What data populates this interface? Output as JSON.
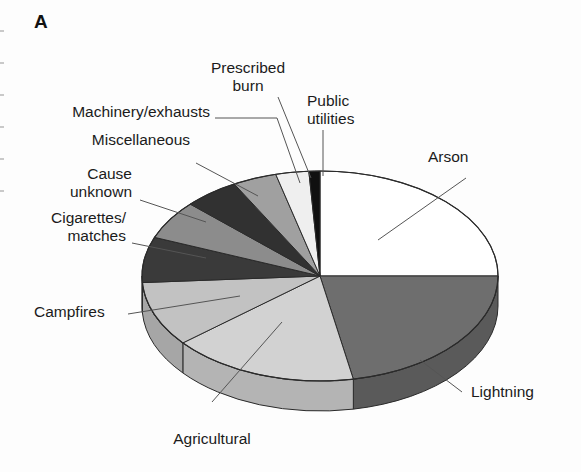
{
  "figure": {
    "panel_label": "A",
    "background_color": "#fdfdfd"
  },
  "chart_data": {
    "type": "pie",
    "title": "",
    "subtitle": "",
    "xlabel": "",
    "ylabel": "",
    "legend_position": "none",
    "grid": false,
    "style": "3d-pie",
    "note": "Causes of wildfires; slices ordered clockwise starting at 12 o'clock.",
    "labels": [
      "Arson",
      "Lightning",
      "Agricultural",
      "Campfires",
      "Cigarettes/\nmatches",
      "Cause\nunknown",
      "Miscellaneous",
      "Machinery/exhausts",
      "Prescribed\nburn",
      "Public\nutilities"
    ],
    "categories": [
      "Arson",
      "Lightning",
      "Agricultural",
      "Campfires",
      "Cigarettes/matches",
      "Cause unknown",
      "Miscellaneous",
      "Machinery/exhausts",
      "Prescribed burn",
      "Public utilities"
    ],
    "values": [
      25,
      22,
      17,
      10,
      7,
      6,
      5,
      4,
      3,
      1
    ],
    "units": "percent",
    "colors": [
      "#ffffff",
      "#6e6e6e",
      "#d2d2d2",
      "#c2c2c2",
      "#3a3a3a",
      "#8c8c8c",
      "#313131",
      "#a0a0a0",
      "#efefef",
      "#101010"
    ],
    "side_colors": [
      "#d8d8d8",
      "#5a5a5a",
      "#b4b4b4",
      "#a6a6a6",
      "#2a2a2a",
      "#757575",
      "#232323",
      "#868686",
      "#cfcfcf",
      "#0b0b0b"
    ]
  },
  "labels": {
    "arson": "Arson",
    "lightning": "Lightning",
    "agricultural": "Agricultural",
    "campfires": "Campfires",
    "cigarettes_line1": "Cigarettes/",
    "cigarettes_line2": "matches",
    "cause_line1": "Cause",
    "cause_line2": "unknown",
    "miscellaneous": "Miscellaneous",
    "machinery": "Machinery/exhausts",
    "prescribed_line1": "Prescribed",
    "prescribed_line2": "burn",
    "utilities_line1": "Public",
    "utilities_line2": "utilities"
  }
}
